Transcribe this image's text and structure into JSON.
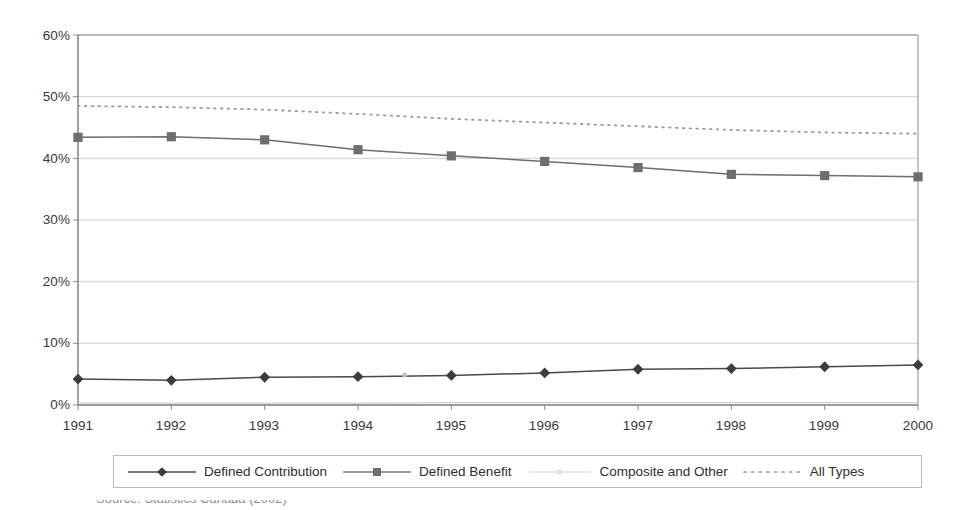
{
  "chart_data": {
    "type": "line",
    "title": "",
    "subtitle": "",
    "xlabel": "",
    "ylabel": "",
    "x": [
      1991,
      1992,
      1993,
      1994,
      1995,
      1996,
      1997,
      1998,
      1999,
      2000
    ],
    "categories": [
      "1991",
      "1992",
      "1993",
      "1994",
      "1995",
      "1996",
      "1997",
      "1998",
      "1999",
      "2000"
    ],
    "xtick_labels": [
      "1991",
      "1992",
      "1993",
      "1994",
      "1995",
      "1996",
      "1997",
      "1998",
      "1999",
      "2000"
    ],
    "ytick_labels": [
      "0%",
      "10%",
      "20%",
      "30%",
      "40%",
      "50%",
      "60%"
    ],
    "ytick_values": [
      0,
      10,
      20,
      30,
      40,
      50,
      60
    ],
    "ylim": [
      0,
      60
    ],
    "xlim": [
      1991,
      2000
    ],
    "yunit": "%",
    "grid": "horizontal",
    "legend_position": "bottom",
    "series": [
      {
        "name": "Defined Contribution",
        "marker": "diamond",
        "linestyle": "solid",
        "color": "#4a4a4a",
        "values": [
          4.2,
          4.0,
          4.5,
          4.6,
          4.8,
          5.2,
          5.8,
          5.9,
          6.2,
          6.5
        ]
      },
      {
        "name": "Defined Benefit",
        "marker": "square",
        "linestyle": "solid",
        "color": "#6e6e6e",
        "values": [
          43.4,
          43.5,
          43.0,
          41.4,
          40.4,
          39.5,
          38.5,
          37.4,
          37.2,
          37.0
        ]
      },
      {
        "name": "Composite and Other",
        "marker": "dot",
        "linestyle": "solid",
        "color": "#cfcfcf",
        "values": [
          0.3,
          0.3,
          0.3,
          0.3,
          0.4,
          0.4,
          0.4,
          0.4,
          0.4,
          0.4
        ]
      },
      {
        "name": "All Types",
        "marker": "none",
        "linestyle": "dotted",
        "color": "#9a9a9a",
        "values": [
          48.5,
          48.3,
          47.9,
          47.2,
          46.4,
          45.8,
          45.2,
          44.6,
          44.2,
          44.0
        ]
      }
    ]
  },
  "legend": {
    "items": [
      {
        "label": "Defined Contribution",
        "key": "diamond-line-key"
      },
      {
        "label": "Defined Benefit",
        "key": "square-line-key"
      },
      {
        "label": "Composite and Other",
        "key": "faint-line-key"
      },
      {
        "label": "All Types",
        "key": "dotted-line-key"
      }
    ]
  },
  "caption": {
    "text": "Source: Statistics Canada (2002)"
  },
  "colors": {
    "plot_border": "#8c8c8c",
    "gridline": "#d0d0d0",
    "axis_text": "#3a3a3a",
    "background": "#ffffff"
  }
}
